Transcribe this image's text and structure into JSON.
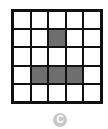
{
  "figure": {
    "rows": 5,
    "cols": 5,
    "shaded_cells": [
      [
        1,
        2
      ],
      [
        3,
        1
      ],
      [
        3,
        2
      ],
      [
        3,
        3
      ]
    ],
    "shade_color": "#6e6e6e",
    "line_color": "#111111",
    "option_label": "C"
  }
}
